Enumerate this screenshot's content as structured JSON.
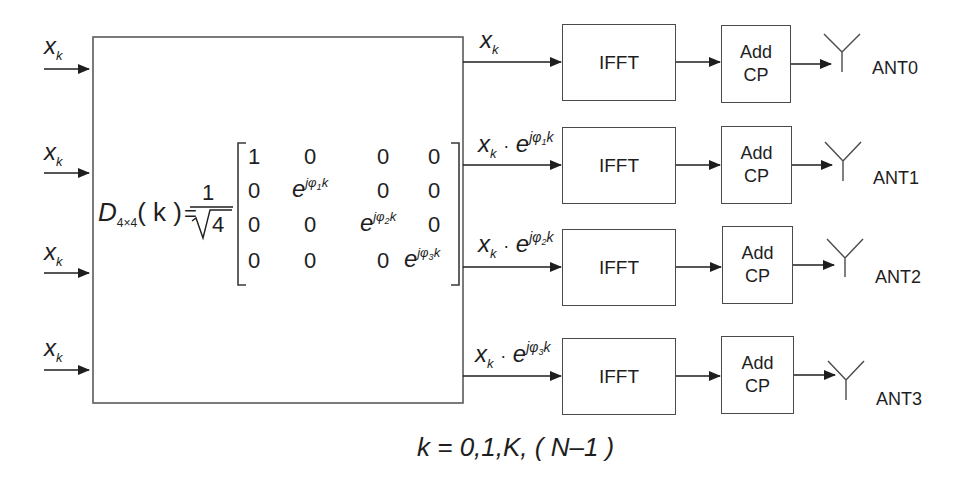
{
  "diagram": {
    "type": "block-diagram"
  },
  "inputs": [
    {
      "symbol": "x",
      "subscript": "k"
    },
    {
      "symbol": "x",
      "subscript": "k"
    },
    {
      "symbol": "x",
      "subscript": "k"
    },
    {
      "symbol": "x",
      "subscript": "k"
    }
  ],
  "matrix_block": {
    "lhs_symbol": "D",
    "lhs_subscript": "4×4",
    "lhs_arg": "( k )",
    "equals": "=",
    "scale_numerator": "1",
    "scale_denominator": "√4",
    "rows": [
      [
        "1",
        "0",
        "0",
        "0"
      ],
      [
        "0",
        "e^{jφ1k}",
        "0",
        "0"
      ],
      [
        "0",
        "0",
        "e^{jφ2k}",
        "0"
      ],
      [
        "0",
        "0",
        "0",
        "e^{jφ3k}"
      ]
    ],
    "cells": {
      "one": "1",
      "zero": "0",
      "e": "e",
      "exp_j": "jφ",
      "k": "k",
      "sub1": "1",
      "sub2": "2",
      "sub3": "3"
    }
  },
  "branches": [
    {
      "signal": "x",
      "signal_sub": "k",
      "phase": "",
      "phase_sub": "",
      "ifft": "IFFT",
      "cp_line1": "Add",
      "cp_line2": "CP",
      "antenna": "ANT0"
    },
    {
      "signal": "x",
      "signal_sub": "k",
      "dot": "·",
      "e": "e",
      "phase": "jφ",
      "phase_sub": "1",
      "k": "k",
      "ifft": "IFFT",
      "cp_line1": "Add",
      "cp_line2": "CP",
      "antenna": "ANT1"
    },
    {
      "signal": "x",
      "signal_sub": "k",
      "dot": "·",
      "e": "e",
      "phase": "jφ",
      "phase_sub": "2",
      "k": "k",
      "ifft": "IFFT",
      "cp_line1": "Add",
      "cp_line2": "CP",
      "antenna": "ANT2"
    },
    {
      "signal": "x",
      "signal_sub": "k",
      "dot": "·",
      "e": "e",
      "phase": "jφ",
      "phase_sub": "3",
      "k": "k",
      "ifft": "IFFT",
      "cp_line1": "Add",
      "cp_line2": "CP",
      "antenna": "ANT3"
    }
  ],
  "footer": {
    "range": "k = 0,1,K, ( N–1 )"
  },
  "colors": {
    "stroke": "#4a4a4a",
    "text": "#1e1e1e",
    "background": "#ffffff"
  }
}
